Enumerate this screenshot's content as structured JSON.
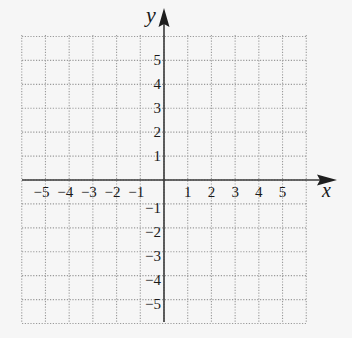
{
  "diagram": {
    "title": "",
    "type": "coordinate-plane",
    "x_axis": {
      "label": "x",
      "min": -6,
      "max": 6,
      "tick_labels": [
        "−5",
        "−4",
        "−3",
        "−2",
        "−1",
        "1",
        "2",
        "3",
        "4",
        "5"
      ],
      "tick_values": [
        -5,
        -4,
        -3,
        -2,
        -1,
        1,
        2,
        3,
        4,
        5
      ],
      "arrow": "positive"
    },
    "y_axis": {
      "label": "y",
      "min": -6,
      "max": 6,
      "tick_labels": [
        "5",
        "4",
        "3",
        "2",
        "1",
        "−1",
        "−2",
        "−3",
        "−4",
        "−5"
      ],
      "tick_values": [
        5,
        4,
        3,
        2,
        1,
        -1,
        -2,
        -3,
        -4,
        -5
      ],
      "arrow": "positive"
    },
    "grid": {
      "style": "dotted",
      "columns": 12,
      "rows": 12,
      "color": "#9a9a9a"
    },
    "colors": {
      "background": "#f6f6f6",
      "axis": "#3a3a3a",
      "text": "#1a1a1a"
    }
  }
}
